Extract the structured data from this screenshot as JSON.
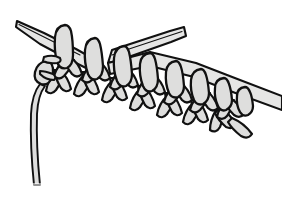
{
  "illustration": {
    "title": "Knitting stitches on two needles",
    "subject": "knitting-diagram",
    "style": "black-outline-line-art",
    "background_color": "#ffffff",
    "yarn_fill_color": "#dededd",
    "needle_fill_color": "#e6e6e5",
    "outline_color": "#111111",
    "caption": "",
    "canvas": {
      "width": 282,
      "height": 205
    },
    "parts": [
      {
        "name": "left-needle",
        "label": "Left knitting needle",
        "tip": {
          "x": 17,
          "y": 21
        },
        "direction": "upper-left",
        "description": "Tapered needle entering from upper left, passing under the stitch loops"
      },
      {
        "name": "right-needle",
        "label": "Right knitting needle",
        "tip": {
          "x": 184,
          "y": 27
        },
        "direction": "upper-right",
        "description": "Tapered needle crossing behind the stitch loops and exiting the right edge"
      },
      {
        "name": "stitch-row",
        "label": "Row of live stitches on needle",
        "count": 9,
        "description": "Oval loops sitting on the needle shaft"
      },
      {
        "name": "knit-fabric",
        "label": "Knitted fabric V-stitches",
        "rows": 2,
        "description": "Rows of V shaped knit stitches hanging below the needle"
      },
      {
        "name": "working-yarn",
        "label": "Working yarn tail",
        "description": "Single strand curving down from the left edge stitch toward the bottom of the frame"
      }
    ]
  }
}
